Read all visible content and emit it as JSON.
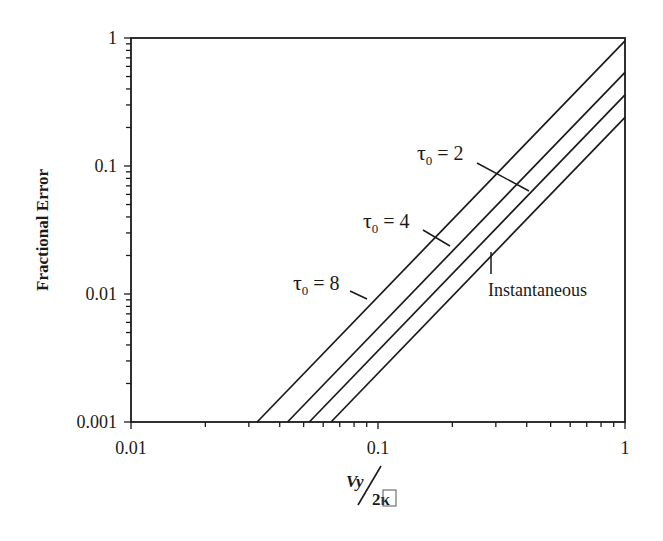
{
  "chart_data": {
    "type": "line",
    "title": "",
    "xlabel": "Vy / 2κ",
    "xlabel_numerator": "Vy",
    "xlabel_denominator": "2κ",
    "ylabel": "Fractional Error",
    "xscale": "log",
    "yscale": "log",
    "xlim": [
      0.01,
      1
    ],
    "ylim": [
      0.001,
      1
    ],
    "x_ticks": [
      0.01,
      0.1,
      1
    ],
    "x_tick_labels": [
      "0.01",
      "0.1",
      "1"
    ],
    "y_ticks": [
      0.001,
      0.01,
      0.1,
      1
    ],
    "y_tick_labels": [
      "0.001",
      "0.01",
      "0.1",
      "1"
    ],
    "grid": false,
    "legend": "none (inline annotations)",
    "series": [
      {
        "name": "τ0 = 8",
        "x": [
          0.0324,
          1.0
        ],
        "y": [
          0.001,
          0.95
        ]
      },
      {
        "name": "τ0 = 4",
        "x": [
          0.043,
          1.0
        ],
        "y": [
          0.001,
          0.54
        ]
      },
      {
        "name": "τ0 = 2",
        "x": [
          0.0527,
          1.0
        ],
        "y": [
          0.001,
          0.36
        ]
      },
      {
        "name": "Instantaneous",
        "x": [
          0.0645,
          1.0
        ],
        "y": [
          0.001,
          0.24
        ]
      }
    ],
    "annotations": [
      {
        "text_main": "τ",
        "text_sub": "0",
        "text_rest": " = 2",
        "series": "τ0 = 2",
        "label_pos": [
          417,
          160
        ],
        "leader": [
          [
            477,
            163
          ],
          [
            529,
            191
          ]
        ]
      },
      {
        "text_main": "τ",
        "text_sub": "0",
        "text_rest": " = 4",
        "series": "τ0 = 4",
        "label_pos": [
          363,
          228
        ],
        "leader": [
          [
            423,
            230
          ],
          [
            450,
            246
          ]
        ]
      },
      {
        "text_main": "τ",
        "text_sub": "0",
        "text_rest": " = 8",
        "series": "τ0 = 8",
        "label_pos": [
          293,
          290
        ],
        "leader": [
          [
            350,
            291
          ],
          [
            367,
            299
          ]
        ]
      },
      {
        "text_main": "Instantaneous",
        "text_sub": "",
        "text_rest": "",
        "series": "Instantaneous",
        "label_pos": [
          488,
          296
        ],
        "leader": [
          [
            491,
            252
          ],
          [
            491,
            274
          ]
        ]
      }
    ]
  },
  "style": {
    "line_color": "#1a1a1a",
    "background": "#ffffff"
  }
}
